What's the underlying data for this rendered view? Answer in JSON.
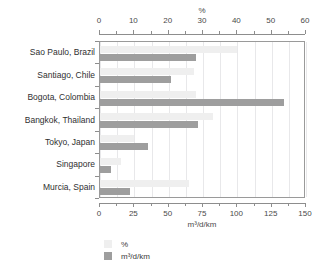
{
  "chart_data": {
    "type": "bar",
    "orientation": "horizontal",
    "title": "",
    "categories": [
      "Sao Paulo, Brazil",
      "Santiago, Chile",
      "Bogota, Colombia",
      "Bangkok, Thailand",
      "Tokyo, Japan",
      "Singapore",
      "Murcia, Spain"
    ],
    "series": [
      {
        "name": "%",
        "axis": "top",
        "color": "#efefef",
        "values": [
          40,
          27.5,
          28,
          33,
          10,
          6,
          26
        ]
      },
      {
        "name": "m³/d/km",
        "axis": "bottom",
        "color": "#9e9e9e",
        "values": [
          70,
          52,
          134,
          71,
          35,
          8,
          22
        ]
      }
    ],
    "axes": {
      "top": {
        "label": "%",
        "min": 0,
        "max": 60,
        "major_step": 10,
        "minor_step": 5,
        "ticks": [
          0,
          10,
          20,
          30,
          40,
          50,
          60
        ],
        "tick_labels": [
          "0",
          "10",
          "20",
          "30",
          "40",
          "50",
          "60"
        ]
      },
      "bottom": {
        "label": "m³/d/km",
        "min": 0,
        "max": 150,
        "major_step": 25,
        "minor_step": 12.5,
        "ticks": [
          0,
          25,
          50,
          75,
          100,
          125,
          150
        ],
        "tick_labels": [
          "0",
          "25",
          "50",
          "75",
          "100",
          "125",
          "150"
        ]
      }
    },
    "grid": true,
    "legend": {
      "position": "bottom-left",
      "entries": [
        {
          "label": "%",
          "color": "#efefef"
        },
        {
          "label": "m³/d/km",
          "color": "#9e9e9e"
        }
      ]
    }
  }
}
